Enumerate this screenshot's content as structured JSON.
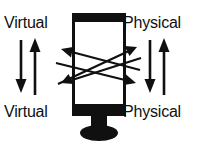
{
  "diagram": {
    "background_color": "#ffffff",
    "ink_color": "#101010",
    "labels": {
      "virtual_top": "Virtual",
      "virtual_bottom": "Virtual",
      "physical_top": "Physical",
      "physical_bottom": "Physical"
    },
    "center_object": {
      "name": "display-monitor",
      "description": "vertical monitor with thick top bezel, thick bottom bezel, neck and elliptical base"
    },
    "vertical_arrows": {
      "left_pair": [
        "down",
        "up"
      ],
      "right_pair": [
        "down",
        "up"
      ]
    },
    "diagonal_arrows": {
      "count": 2,
      "style": "double-headed",
      "pattern": "crossing X",
      "directions": [
        "up-left/down-right",
        "down-left/up-right"
      ]
    }
  }
}
